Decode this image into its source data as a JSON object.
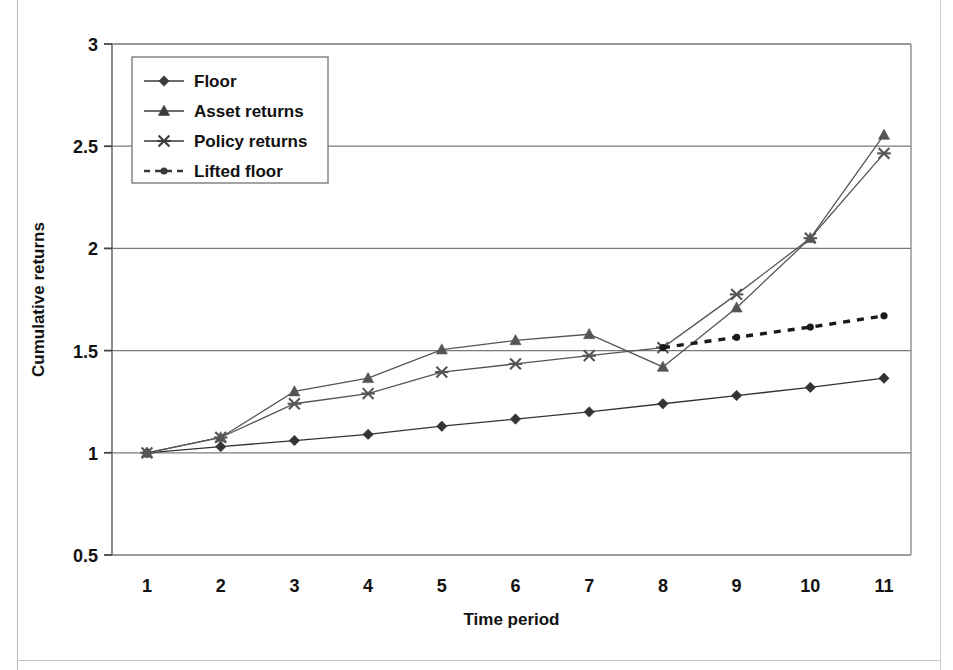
{
  "chart_data": {
    "type": "line",
    "title": "",
    "xlabel": "Time period",
    "ylabel": "Cumulative returns",
    "x": [
      1,
      2,
      3,
      4,
      5,
      6,
      7,
      8,
      9,
      10,
      11
    ],
    "categories": [
      "1",
      "2",
      "3",
      "4",
      "5",
      "6",
      "7",
      "8",
      "9",
      "10",
      "11"
    ],
    "xlim": [
      1,
      11
    ],
    "ylim": [
      0.5,
      3
    ],
    "yticks": [
      0.5,
      1,
      1.5,
      2,
      2.5,
      3
    ],
    "ytick_labels": [
      "0.5",
      "1",
      "1.5",
      "2",
      "2.5",
      "3"
    ],
    "grid": "horizontal",
    "legend_position": "top-left",
    "series": [
      {
        "name": "Floor",
        "marker": "diamond",
        "line_style": "solid",
        "color": "#333333",
        "x": [
          1,
          2,
          3,
          4,
          5,
          6,
          7,
          8,
          9,
          10,
          11
        ],
        "values": [
          1.0,
          1.03,
          1.06,
          1.09,
          1.13,
          1.165,
          1.2,
          1.24,
          1.28,
          1.32,
          1.365
        ]
      },
      {
        "name": "Asset returns",
        "marker": "triangle",
        "line_style": "solid",
        "color": "#555555",
        "x": [
          1,
          2,
          3,
          4,
          5,
          6,
          7,
          8,
          9,
          10,
          11
        ],
        "values": [
          1.0,
          1.075,
          1.3,
          1.365,
          1.505,
          1.55,
          1.58,
          1.42,
          1.71,
          2.05,
          2.555
        ]
      },
      {
        "name": "Policy returns",
        "marker": "asterisk",
        "line_style": "solid",
        "color": "#555555",
        "x": [
          1,
          2,
          3,
          4,
          5,
          6,
          7,
          8,
          9,
          10,
          11
        ],
        "values": [
          1.0,
          1.075,
          1.24,
          1.29,
          1.395,
          1.435,
          1.475,
          1.515,
          1.775,
          2.05,
          2.465
        ]
      },
      {
        "name": "Lifted floor",
        "marker": "dot",
        "line_style": "dashed",
        "color": "#1a1a1a",
        "x": [
          8,
          9,
          10,
          11
        ],
        "values": [
          1.515,
          1.565,
          1.615,
          1.67
        ]
      }
    ]
  },
  "legend": {
    "items": [
      {
        "label": "Floor"
      },
      {
        "label": "Asset returns"
      },
      {
        "label": "Policy returns"
      },
      {
        "label": "Lifted floor"
      }
    ]
  },
  "axes": {
    "y_title": "Cumulative returns",
    "x_title": "Time period",
    "y_tick_labels": [
      "3",
      "2.5",
      "2",
      "1.5",
      "1",
      "0.5"
    ],
    "x_tick_labels": [
      "1",
      "2",
      "3",
      "4",
      "5",
      "6",
      "7",
      "8",
      "9",
      "10",
      "11"
    ]
  }
}
